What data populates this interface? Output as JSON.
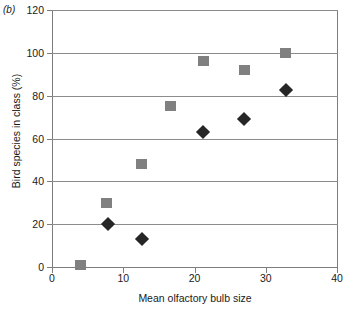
{
  "panel": {
    "label": "(b)"
  },
  "chart_data": {
    "type": "scatter",
    "title": "",
    "xlabel": "Mean olfactory bulb size",
    "ylabel": "Bird species in class (%)",
    "xlim": [
      0,
      40
    ],
    "ylim": [
      0,
      120
    ],
    "xticks": [
      0,
      10,
      20,
      30,
      40
    ],
    "yticks": [
      0,
      20,
      40,
      60,
      80,
      100,
      120
    ],
    "grid": "horizontal",
    "legend": "none",
    "series": [
      {
        "name": "gray-squares",
        "marker": "square",
        "color": "#808080",
        "points": [
          {
            "x": 4.0,
            "y": 1
          },
          {
            "x": 7.7,
            "y": 30
          },
          {
            "x": 12.6,
            "y": 48
          },
          {
            "x": 16.7,
            "y": 75
          },
          {
            "x": 21.2,
            "y": 96
          },
          {
            "x": 27.0,
            "y": 92
          },
          {
            "x": 32.8,
            "y": 100
          }
        ]
      },
      {
        "name": "dark-diamonds",
        "marker": "diamond",
        "color": "#262626",
        "points": [
          {
            "x": 7.9,
            "y": 20
          },
          {
            "x": 12.6,
            "y": 13
          },
          {
            "x": 21.2,
            "y": 63
          },
          {
            "x": 27.0,
            "y": 69
          },
          {
            "x": 32.9,
            "y": 82.5
          }
        ]
      }
    ]
  }
}
